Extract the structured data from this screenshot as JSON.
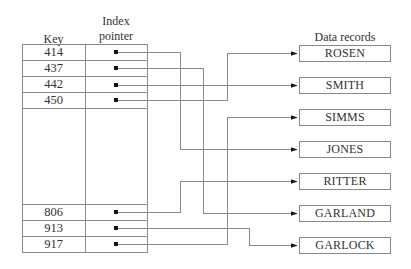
{
  "headers": {
    "key": "Key",
    "index_line1": "Index",
    "index_line2": "pointer",
    "records": "Data records"
  },
  "index_rows": [
    {
      "key": "414",
      "points_to": "JONES"
    },
    {
      "key": "437",
      "points_to": "GARLAND"
    },
    {
      "key": "442",
      "points_to": "SMITH"
    },
    {
      "key": "450",
      "points_to": "ROSEN"
    },
    {
      "key": "806",
      "points_to": "RITTER"
    },
    {
      "key": "913",
      "points_to": "GARLOCK"
    },
    {
      "key": "917",
      "points_to": "SIMMS"
    }
  ],
  "records": [
    "ROSEN",
    "SMITH",
    "SIMMS",
    "JONES",
    "RITTER",
    "GARLAND",
    "GARLOCK"
  ],
  "colors": {
    "line": "#8a8a8a",
    "border": "#8a8a8a",
    "text": "#333333",
    "pointer": "#111111"
  }
}
